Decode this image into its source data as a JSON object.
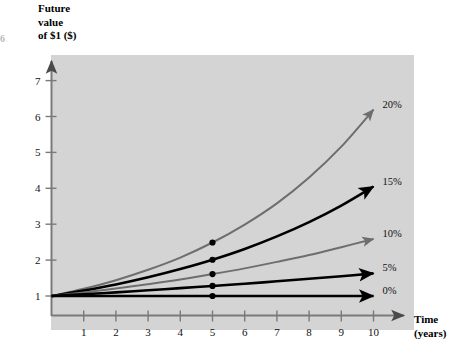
{
  "figure": {
    "edge_mark": "6"
  },
  "chart_data": {
    "type": "line",
    "title": "",
    "ylabel": "Future value of $1 ($)",
    "ylabel_lines": [
      "Future",
      "value",
      "of $1 ($)"
    ],
    "xlabel": "Time (years)",
    "xlabel_lines": [
      "Time",
      "(years)"
    ],
    "xlim": [
      0,
      10.6
    ],
    "ylim": [
      0,
      7.6
    ],
    "x": [
      0,
      1,
      2,
      3,
      4,
      5,
      6,
      7,
      8,
      9,
      10
    ],
    "x_tick_labels": [
      "1",
      "2",
      "3",
      "4",
      "5",
      "6",
      "7",
      "8",
      "9",
      "10"
    ],
    "x_ticks": [
      1,
      2,
      3,
      4,
      5,
      6,
      7,
      8,
      9,
      10
    ],
    "y_tick_labels": [
      "1",
      "2",
      "3",
      "4",
      "5",
      "6",
      "7"
    ],
    "y_ticks": [
      1,
      2,
      3,
      4,
      5,
      6,
      7
    ],
    "grid": false,
    "legend_position": "right-of-curve-end",
    "marker_year": 5,
    "series": [
      {
        "name": "20%",
        "label": "20%",
        "rate": 0.2,
        "color": "#6e6e6e",
        "values": [
          1.0,
          1.2,
          1.44,
          1.73,
          2.07,
          2.49,
          2.99,
          3.58,
          4.3,
          5.16,
          6.19
        ],
        "marker_value": 2.49,
        "end_value": 6.19
      },
      {
        "name": "15%",
        "label": "15%",
        "rate": 0.15,
        "color": "#000000",
        "values": [
          1.0,
          1.15,
          1.32,
          1.52,
          1.75,
          2.01,
          2.31,
          2.66,
          3.06,
          3.52,
          4.05
        ],
        "marker_value": 2.01,
        "end_value": 4.05
      },
      {
        "name": "10%",
        "label": "10%",
        "rate": 0.1,
        "color": "#6e6e6e",
        "values": [
          1.0,
          1.1,
          1.21,
          1.33,
          1.46,
          1.61,
          1.77,
          1.95,
          2.14,
          2.36,
          2.59
        ],
        "marker_value": 1.61,
        "end_value": 2.59
      },
      {
        "name": "5%",
        "label": "5%",
        "rate": 0.05,
        "color": "#000000",
        "values": [
          1.0,
          1.05,
          1.1,
          1.16,
          1.22,
          1.28,
          1.34,
          1.41,
          1.48,
          1.55,
          1.63
        ],
        "marker_value": 1.28,
        "end_value": 1.63
      },
      {
        "name": "0%",
        "label": "0%",
        "rate": 0.0,
        "color": "#000000",
        "values": [
          1.0,
          1.0,
          1.0,
          1.0,
          1.0,
          1.0,
          1.0,
          1.0,
          1.0,
          1.0,
          1.0
        ],
        "marker_value": 1.0,
        "end_value": 1.0
      }
    ],
    "colors": {
      "panel_background": "#d4d4d4",
      "axis": "#6b6b6b",
      "marker_dot": "#000000",
      "curve_black": "#000000",
      "curve_gray": "#6e6e6e"
    }
  }
}
